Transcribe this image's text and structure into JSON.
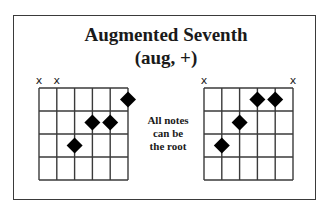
{
  "title": "Augmented Seventh",
  "subtitle": "(aug, +)",
  "note": [
    "All notes",
    "can be",
    "the root"
  ],
  "colors": {
    "line": "#3a3a3a",
    "dot": "#000000",
    "background": "#ffffff"
  },
  "diagrams": [
    {
      "name": "left-chord",
      "strings": 6,
      "frets": 4,
      "muted": [
        1,
        2
      ],
      "dots": [
        {
          "string": 3,
          "fret": 3
        },
        {
          "string": 4,
          "fret": 2
        },
        {
          "string": 5,
          "fret": 2
        },
        {
          "string": 6,
          "fret": 1
        }
      ],
      "grid": {
        "x": 39,
        "y": 88,
        "w": 89,
        "h": 92
      }
    },
    {
      "name": "right-chord",
      "strings": 6,
      "frets": 4,
      "muted": [
        1,
        6
      ],
      "dots": [
        {
          "string": 2,
          "fret": 3
        },
        {
          "string": 3,
          "fret": 2
        },
        {
          "string": 4,
          "fret": 1
        },
        {
          "string": 5,
          "fret": 1
        }
      ],
      "grid": {
        "x": 204,
        "y": 88,
        "w": 89,
        "h": 92
      }
    }
  ],
  "mute_symbol": "x"
}
